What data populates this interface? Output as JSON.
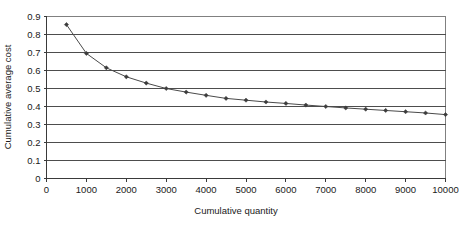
{
  "chart_data": {
    "type": "line",
    "title": "",
    "xlabel": "Cumulative quantity",
    "ylabel": "Cumulative average cost",
    "xlim": [
      0,
      10000
    ],
    "ylim": [
      0,
      0.9
    ],
    "xticks": [
      0,
      1000,
      2000,
      3000,
      4000,
      5000,
      6000,
      7000,
      8000,
      9000,
      10000
    ],
    "xtick_labels": [
      "0",
      "1000",
      "2000",
      "3000",
      "4000",
      "5000",
      "6000",
      "7000",
      "8000",
      "9000",
      "10000"
    ],
    "yticks": [
      0,
      0.1,
      0.2,
      0.3,
      0.4,
      0.5,
      0.6,
      0.7,
      0.8,
      0.9
    ],
    "ytick_labels": [
      "0",
      "0.1",
      "0.2",
      "0.3",
      "0.4",
      "0.5",
      "0.6",
      "0.7",
      "0.8",
      "0.9"
    ],
    "grid": true,
    "grid_axis": "y",
    "legend": false,
    "legend_position": "none",
    "marker": "diamond",
    "series": [
      {
        "name": "Cumulative average cost",
        "x": [
          500,
          1000,
          1500,
          2000,
          2500,
          3000,
          3500,
          4000,
          4500,
          5000,
          5500,
          6000,
          6500,
          7000,
          7500,
          8000,
          8500,
          9000,
          9500,
          10000
        ],
        "values": [
          0.855,
          0.695,
          0.615,
          0.565,
          0.53,
          0.5,
          0.48,
          0.462,
          0.445,
          0.435,
          0.425,
          0.417,
          0.408,
          0.4,
          0.392,
          0.385,
          0.378,
          0.371,
          0.364,
          0.355
        ]
      }
    ]
  },
  "axis_titles": {
    "x": "Cumulative quantity",
    "y": "Cumulative average cost"
  }
}
